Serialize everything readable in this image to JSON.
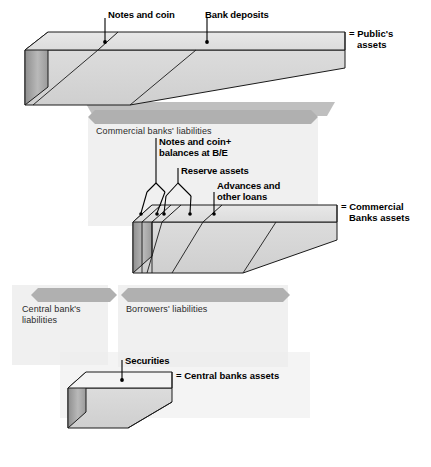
{
  "figure": {
    "background_color": "#ffffff",
    "ink_color": "#000000",
    "slab_top_fill": "#e3e3e3",
    "slab_front_fill": "#d6d6d6",
    "slab_end_fill": "#a8a8a8",
    "banner_fill": "#b0b0b0",
    "shadow_fill": "#b4b4b4",
    "panel_fill": "#ececec"
  },
  "layers": [
    {
      "id": "public",
      "right_label_lines": [
        "= Public's",
        "assets"
      ],
      "segments": [
        {
          "name": "Notes and coin",
          "callout": "Notes and coin"
        },
        {
          "name": "Bank deposits",
          "callout": "Bank deposits"
        }
      ]
    },
    {
      "id": "commercial-banks",
      "right_label_lines": [
        "= Commercial",
        "Banks assets"
      ],
      "segments": [
        {
          "name": "Notes and coin + balances at B/E",
          "callout_lines": [
            "Notes and coin+",
            "balances at B/E"
          ]
        },
        {
          "name": "Reserve assets",
          "callout_lines": [
            "Reserve assets"
          ]
        },
        {
          "name": "Advances and other loans",
          "callout_lines": [
            "Advances and",
            "other loans"
          ]
        }
      ]
    },
    {
      "id": "central-bank",
      "right_label_lines": [
        "= Central banks assets"
      ],
      "segments": [
        {
          "name": "Securities",
          "callout": "Securities"
        }
      ]
    }
  ],
  "banners": [
    {
      "id": "commercial-banks-liabilities",
      "text": "Commercial banks' liabilities"
    },
    {
      "id": "central-bank-liabilities",
      "text_lines": [
        "Central bank's",
        "liabilities"
      ]
    },
    {
      "id": "borrowers-liabilities",
      "text_lines": [
        "Borrowers' liabilities"
      ]
    }
  ],
  "callouts": {
    "notes_and_coin": "Notes and coin",
    "bank_deposits": "Bank deposits",
    "notes_coin_balances_l1": "Notes and coin+",
    "notes_coin_balances_l2": "balances at B/E",
    "reserve_assets": "Reserve assets",
    "advances_l1": "Advances and",
    "advances_l2": "other loans",
    "securities": "Securities"
  },
  "right_labels": {
    "publics_assets_l1": "= Public's",
    "publics_assets_l2": "assets",
    "commercial_banks_l1": "= Commercial",
    "commercial_banks_l2": "Banks assets",
    "central_banks": "= Central banks assets"
  },
  "banner_text": {
    "commercial_banks_liabilities": "Commercial banks' liabilities",
    "central_bank_liabilities_l1": "Central bank's",
    "central_bank_liabilities_l2": "liabilities",
    "borrowers_liabilities": "Borrowers' liabilities"
  }
}
